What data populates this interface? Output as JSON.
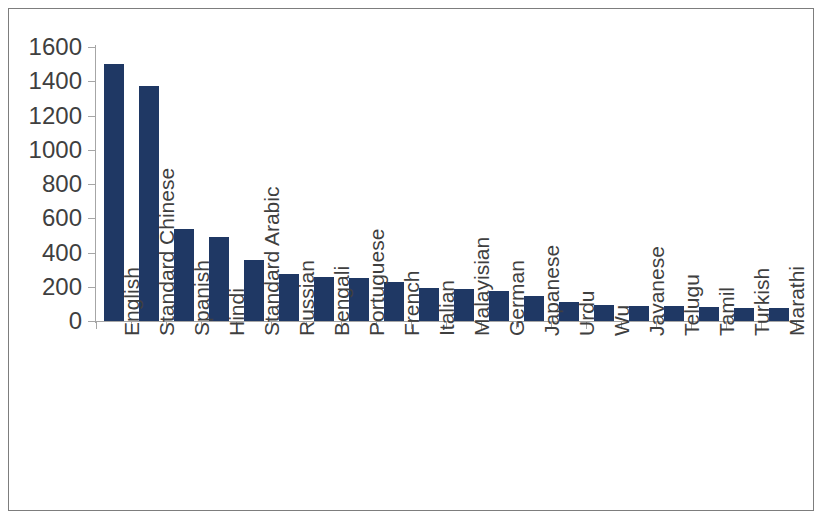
{
  "chart_data": {
    "type": "bar",
    "title": "",
    "subtitle": "",
    "xlabel": "",
    "ylabel": "",
    "ylim": [
      0,
      1600
    ],
    "ytick_step": 200,
    "yticks": [
      0,
      200,
      400,
      600,
      800,
      1000,
      1200,
      1400,
      1600
    ],
    "grid": false,
    "legend": false,
    "legend_position": "none",
    "bar_color": "#1f3864",
    "axis_color": "#a6a6a6",
    "text_color": "#3f3f3f",
    "frame_color": "#7d7d7d",
    "categories": [
      "English",
      "Standard Chinese",
      "Spanish",
      "Hindi",
      "Standard Arabic",
      "Russian",
      "Bengali",
      "Portuguese",
      "French",
      "Italian",
      "Malayisian",
      "German",
      "Japanese",
      "Urdu",
      "Wu",
      "Javanese",
      "Telugu",
      "Tamil",
      "Turkish",
      "Marathi"
    ],
    "values": [
      1500,
      1370,
      535,
      490,
      355,
      275,
      255,
      250,
      225,
      190,
      185,
      175,
      145,
      110,
      95,
      90,
      85,
      80,
      78,
      75
    ]
  }
}
